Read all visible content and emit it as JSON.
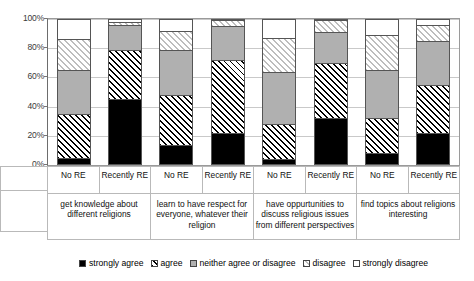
{
  "chart_data": {
    "type": "bar",
    "subtype": "stacked-percent",
    "title": "",
    "xlabel": "",
    "ylabel": "",
    "ylim": [
      0,
      100
    ],
    "ytick_labels": [
      "0%",
      "20%",
      "40%",
      "60%",
      "80%",
      "100%"
    ],
    "ytick_values": [
      0,
      20,
      40,
      60,
      80,
      100
    ],
    "grid": true,
    "legend_position": "bottom",
    "legend": [
      "strongly agree",
      "agree",
      "neither agree or disagree",
      "disagree",
      "strongly disagree"
    ],
    "series": [
      {
        "name": "strongly agree",
        "values": [
          5,
          45,
          14,
          22,
          4,
          32,
          8,
          22
        ]
      },
      {
        "name": "agree",
        "values": [
          30,
          34,
          34,
          50,
          24,
          38,
          24,
          33
        ]
      },
      {
        "name": "neither agree or disagree",
        "values": [
          30,
          17,
          31,
          23,
          36,
          21,
          33,
          30
        ]
      },
      {
        "name": "disagree",
        "values": [
          21,
          2,
          13,
          4,
          23,
          8,
          24,
          11
        ]
      },
      {
        "name": "strongly disagree",
        "values": [
          14,
          2,
          8,
          1,
          13,
          1,
          11,
          4
        ]
      }
    ],
    "categories": [
      "No RE",
      "Recently RE",
      "No RE",
      "Recently RE",
      "No RE",
      "Recently RE",
      "No RE",
      "Recently RE"
    ],
    "groups": [
      {
        "label": "get knowledge about different religions",
        "bars": [
          "No RE",
          "Recently RE"
        ]
      },
      {
        "label": "learn to have respect for everyone, whatever their religion",
        "bars": [
          "No RE",
          "Recently RE"
        ]
      },
      {
        "label": "have oppurtunities to discuss religious issues from different perspectives",
        "bars": [
          "No RE",
          "Recently RE"
        ]
      },
      {
        "label": "find topics about religions interesting",
        "bars": [
          "No RE",
          "Recently RE"
        ]
      }
    ],
    "colors": {
      "strongly_agree": "#000000",
      "agree": "#ffffff",
      "neither": "#b0b0b0",
      "disagree": "#ffffff",
      "strongly_disagree": "#ffffff",
      "grid": "#c9c9c9",
      "axis": "#6d6d6d"
    }
  },
  "axis": {
    "ticks": [
      "100%",
      "80%",
      "60%",
      "40%",
      "20%",
      "0%"
    ]
  },
  "subcategory_labels": [
    "No RE",
    "Recently RE",
    "No RE",
    "Recently RE",
    "No RE",
    "Recently RE",
    "No RE",
    "Recently RE"
  ],
  "group_labels": [
    "get knowledge about different religions",
    "learn to have respect for everyone, whatever their religion",
    "have oppurtunities to discuss religious issues from different perspectives",
    "find topics about religions interesting"
  ],
  "legend_labels": [
    "strongly agree",
    "agree",
    "neither agree or disagree",
    "disagree",
    "strongly disagree"
  ]
}
